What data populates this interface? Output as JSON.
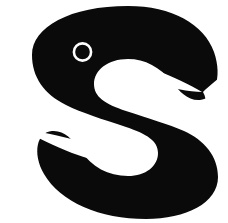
{
  "image": {
    "kind": "logo-glyph",
    "subject": "letter-s",
    "description": "Bold black stylized lowercase letter s on a plain white background, with a small white circular ring in the upper bowl and two tapering white spurs.",
    "width": 228,
    "height": 223,
    "background_color": "#ffffff",
    "foreground_color": "#0a0a0a",
    "accent_color": "#ffffff"
  },
  "shapes": {
    "body": {
      "name": "letter-s-body",
      "fill": "#0a0a0a",
      "path": "M 128 6 C 172 6 204 24 214 52 C 223 78 214 99 200 100 C 188 101 180 92 172 82 C 160 67 145 59 128 59 C 108 59 94 70 94 84 C 94 97 105 104 126 111 C 150 119 168 124 184 131 C 204 140 218 156 218 177 C 218 203 186 219 146 219 C 100 219 60 202 44 174 C 32 153 37 132 52 131 C 64 130 72 139 80 150 C 92 167 108 176 128 176 C 146 176 158 166 158 153 C 158 141 147 134 126 127 C 102 119 82 113 66 105 C 44 94 32 77 32 55 C 32 27 70 6 128 6 Z"
    },
    "eye_ring": {
      "name": "eye-ring",
      "stroke": "#ffffff",
      "fill": "none",
      "cx": 82.5,
      "cy": 52,
      "r": 8.6,
      "stroke_width": 2.6
    },
    "upper_spur": {
      "name": "upper-spur",
      "fill": "#ffffff",
      "path": "M 118 62 C 126 61 140 64 156 70 C 174 77 190 85 202 92 C 190 92 170 88 150 82 C 132 77 121 72 116 69 C 112 67 113 63 118 62 Z"
    },
    "lower_spur": {
      "name": "lower-spur",
      "fill": "#ffffff",
      "path": "M 110 161 C 102 162 88 159 72 153 C 54 146 38 138 26 131 C 38 131 58 135 78 141 C 96 146 107 151 112 154 C 116 156 115 160 110 161 Z"
    },
    "upper_notch": {
      "name": "upper-right-notch",
      "fill": "#ffffff",
      "path": "M 228 72 L 228 124 L 200 124 C 206 112 208 100 203 92 C 210 85 220 77 228 72 Z"
    },
    "lower_notch": {
      "name": "lower-left-notch",
      "fill": "#ffffff",
      "path": "M 0 99 L 0 151 L 28 151 C 22 139 20 127 25 119 C 18 112 8 104 0 99 Z"
    }
  }
}
